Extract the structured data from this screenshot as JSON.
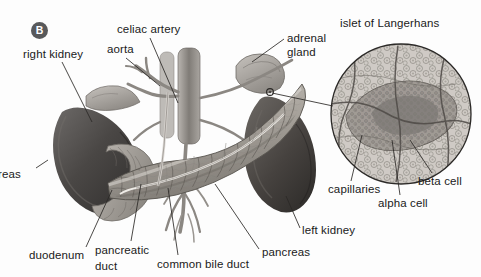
{
  "figure": {
    "panel_badge": "B",
    "inset_title": "islet of Langerhans",
    "background_color": "#fdfdfd",
    "ink_color": "#1a1a1a",
    "badge_color": "#58595b"
  },
  "labels": [
    {
      "id": "right-kidney",
      "text": "right kidney",
      "x": 23,
      "y": 48,
      "align": "left"
    },
    {
      "id": "celiac-artery",
      "text": "celiac artery",
      "x": 117,
      "y": 23,
      "align": "left"
    },
    {
      "id": "aorta",
      "text": "aorta",
      "x": 107,
      "y": 43,
      "align": "left"
    },
    {
      "id": "adrenal-gland-1",
      "text": "adrenal",
      "x": 287,
      "y": 32,
      "align": "left"
    },
    {
      "id": "adrenal-gland-2",
      "text": "gland",
      "x": 287,
      "y": 46,
      "align": "left"
    },
    {
      "id": "islet-title",
      "text": "islet of Langerhans",
      "x": 340,
      "y": 17,
      "align": "left"
    },
    {
      "id": "pancreas-cut",
      "text": "reas",
      "x": -2,
      "y": 168,
      "align": "left"
    },
    {
      "id": "capillaries",
      "text": "capillaries",
      "x": 328,
      "y": 183,
      "align": "left"
    },
    {
      "id": "beta-cell",
      "text": "beta cell",
      "x": 418,
      "y": 175,
      "align": "left"
    },
    {
      "id": "alpha-cell",
      "text": "alpha cell",
      "x": 378,
      "y": 197,
      "align": "left"
    },
    {
      "id": "left-kidney",
      "text": "left kidney",
      "x": 302,
      "y": 224,
      "align": "left"
    },
    {
      "id": "pancreas",
      "text": "pancreas",
      "x": 262,
      "y": 246,
      "align": "left"
    },
    {
      "id": "duodenum",
      "text": "duodenum",
      "x": 29,
      "y": 249,
      "align": "left"
    },
    {
      "id": "pancreatic-duct-1",
      "text": "pancreatic",
      "x": 95,
      "y": 244,
      "align": "left"
    },
    {
      "id": "pancreatic-duct-2",
      "text": "duct",
      "x": 95,
      "y": 260,
      "align": "left"
    },
    {
      "id": "common-bile-duct",
      "text": "common bile duct",
      "x": 157,
      "y": 258,
      "align": "left"
    }
  ],
  "leader_lines": [
    {
      "id": "right-kidney",
      "x1": 62,
      "y1": 62,
      "x2": 92,
      "y2": 122
    },
    {
      "id": "celiac-artery",
      "x1": 150,
      "y1": 38,
      "x2": 178,
      "y2": 103
    },
    {
      "id": "aorta",
      "x1": 126,
      "y1": 58,
      "x2": 160,
      "y2": 86
    },
    {
      "id": "adrenal-gland",
      "x1": 284,
      "y1": 39,
      "x2": 252,
      "y2": 62
    },
    {
      "id": "islet-pointer",
      "x1": 270,
      "y1": 92,
      "x2": 333,
      "y2": 104
    },
    {
      "id": "capillaries",
      "x1": 351,
      "y1": 181,
      "x2": 362,
      "y2": 135
    },
    {
      "id": "beta-cell",
      "x1": 432,
      "y1": 173,
      "x2": 410,
      "y2": 140
    },
    {
      "id": "alpha-cell",
      "x1": 400,
      "y1": 195,
      "x2": 392,
      "y2": 140
    },
    {
      "id": "left-kidney",
      "x1": 300,
      "y1": 228,
      "x2": 286,
      "y2": 196
    },
    {
      "id": "pancreas",
      "x1": 259,
      "y1": 249,
      "x2": 215,
      "y2": 184
    },
    {
      "id": "duodenum",
      "x1": 86,
      "y1": 247,
      "x2": 112,
      "y2": 190
    },
    {
      "id": "pancreatic-duct",
      "x1": 131,
      "y1": 241,
      "x2": 141,
      "y2": 184
    },
    {
      "id": "common-bile-duct",
      "x1": 178,
      "y1": 255,
      "x2": 168,
      "y2": 188
    }
  ],
  "inset": {
    "circle": {
      "cx": 401,
      "cy": 114,
      "r": 70
    },
    "description": "islet-of-langerhans-micrograph"
  }
}
